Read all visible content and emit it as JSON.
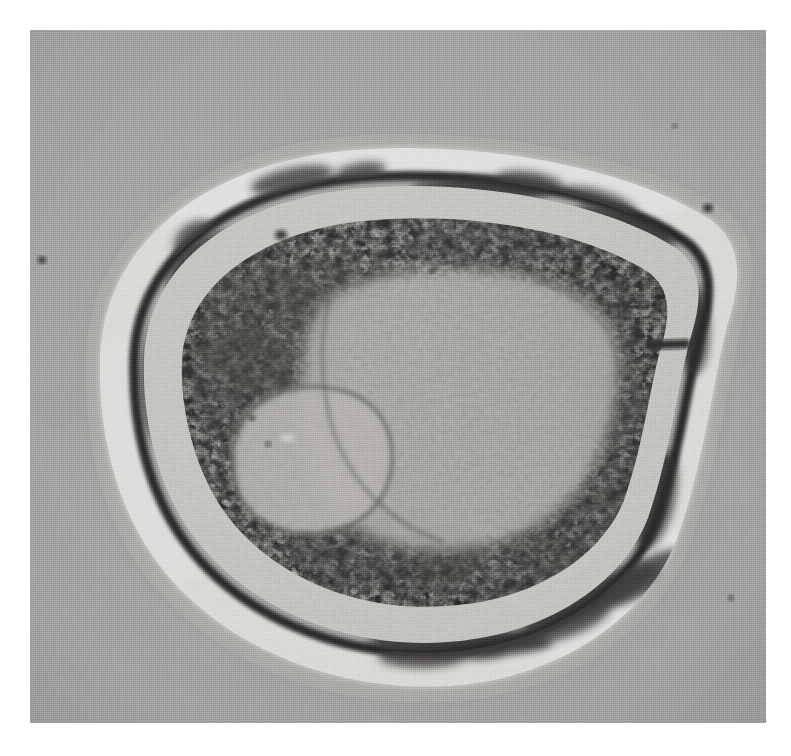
{
  "figure": {
    "kind": "transmission-electron-micrograph",
    "alt_text": "Black-and-white transmission electron micrograph of a single bacterium sectioned transversely, showing an outer capsule layer, a dark electron-dense cell wall, a granular cytoplasm with ribosomes, a pale fibrillar nucleoid, and one oval electron-lucent inclusion body.",
    "plate": {
      "left": 30,
      "top": 30,
      "width": 736,
      "height": 693,
      "background_color": "#a9a9a7",
      "border_color": "#ffffff"
    }
  },
  "structures": [
    {
      "name": "outer-halo",
      "label": "Outer diffuse halo / slime layer",
      "color": "#b4b4b2"
    },
    {
      "name": "capsule",
      "label": "Capsule (electron-lucent outer layer)",
      "color": "#f2f1ec"
    },
    {
      "name": "cell-wall",
      "label": "Cell wall (electron-dense line)",
      "color": "#151413"
    },
    {
      "name": "periplasm",
      "label": "Periplasmic / wall granular zone",
      "color": "#cfcec8"
    },
    {
      "name": "cytoplasm",
      "label": "Cytoplasm with ribosomes",
      "color": "#9b9a93"
    },
    {
      "name": "nucleoid",
      "label": "Nucleoid (fibrillar DNA region)",
      "color": "#adaba2"
    },
    {
      "name": "inclusion-body",
      "label": "Electron-lucent inclusion body",
      "color": "#b9b7ae"
    },
    {
      "name": "dark-bar-artifact",
      "label": "Dense stain deposit (bar)",
      "color": "#14110f"
    }
  ],
  "specks": [
    {
      "name": "speck-left-margin",
      "cx": 42,
      "cy": 260,
      "r": 4.0
    },
    {
      "name": "speck-top-right",
      "cx": 708,
      "cy": 208,
      "r": 5.0
    },
    {
      "name": "speck-upper-field",
      "cx": 675,
      "cy": 126,
      "r": 2.4
    },
    {
      "name": "speck-cytoplasm-top",
      "cx": 281,
      "cy": 235,
      "r": 6.0
    },
    {
      "name": "speck-nucleoid-a",
      "cx": 432,
      "cy": 271,
      "r": 3.0
    },
    {
      "name": "speck-inclusion-a",
      "cx": 252,
      "cy": 418,
      "r": 3.2
    },
    {
      "name": "speck-inclusion-b",
      "cx": 268,
      "cy": 444,
      "r": 2.6
    },
    {
      "name": "speck-lower-right",
      "cx": 731,
      "cy": 598,
      "r": 2.6
    }
  ],
  "scale_bar": {
    "present": false,
    "label": ""
  },
  "labels": {
    "present": false,
    "items": []
  }
}
